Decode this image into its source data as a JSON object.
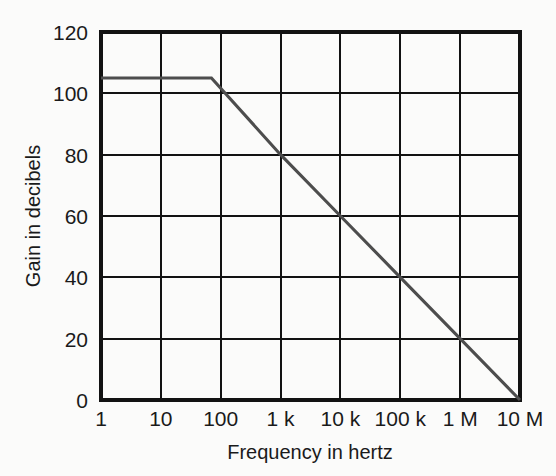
{
  "chart_data": {
    "type": "line",
    "title": "",
    "xlabel": "Frequency in hertz",
    "ylabel": "Gain in decibels",
    "xscale": "log",
    "yscale": "linear",
    "xlim": [
      1,
      10000000
    ],
    "ylim": [
      0,
      120
    ],
    "grid": true,
    "legend": null,
    "x_tick_labels": [
      "1",
      "10",
      "100",
      "1 k",
      "10 k",
      "100 k",
      "1 M",
      "10 M"
    ],
    "x_tick_values": [
      1,
      10,
      100,
      1000,
      10000,
      100000,
      1000000,
      10000000
    ],
    "y_tick_labels": [
      "0",
      "20",
      "40",
      "60",
      "80",
      "100",
      "120"
    ],
    "y_tick_values": [
      0,
      20,
      40,
      60,
      80,
      100,
      120
    ],
    "series": [
      {
        "name": "Open-loop gain",
        "color": "#4d4d4d",
        "points": [
          {
            "x": 1,
            "y": 105
          },
          {
            "x": 70,
            "y": 105
          },
          {
            "x": 1000,
            "y": 80
          },
          {
            "x": 10000,
            "y": 60
          },
          {
            "x": 100000,
            "y": 40
          },
          {
            "x": 1000000,
            "y": 20
          },
          {
            "x": 10000000,
            "y": 0
          }
        ],
        "description": "Flat at 105 dB to the 70 Hz break frequency, then rolls off at -20 dB per decade to 0 dB at 10 MHz"
      }
    ]
  },
  "colors": {
    "background": "#fbfbfa",
    "axis": "#121212",
    "grid": "#121212",
    "curve": "#4d4d4d",
    "text": "#1a1a1a"
  },
  "geometry": {
    "plot_left": 101,
    "plot_right": 520,
    "plot_top": 32,
    "plot_bottom": 400
  }
}
